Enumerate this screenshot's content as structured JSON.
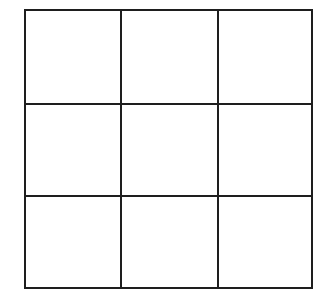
{
  "diagram": {
    "type": "grid",
    "rows": 3,
    "cols": 3,
    "line_color": "#1e1e1e",
    "background": "#ffffff",
    "cells": [
      [
        "",
        "",
        ""
      ],
      [
        "",
        "",
        ""
      ],
      [
        "",
        "",
        ""
      ]
    ],
    "x_lines": [
      25,
      121,
      218,
      312
    ],
    "y_lines": [
      10,
      104,
      196,
      288
    ]
  }
}
